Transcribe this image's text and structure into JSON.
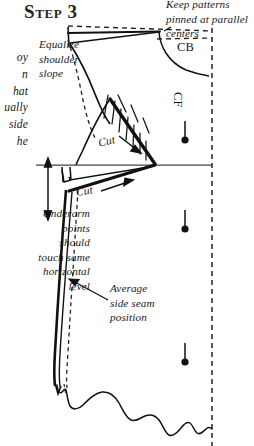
{
  "page": {
    "title": "Step 3",
    "width": 254,
    "height": 446,
    "background_color": "#ffffff",
    "ink_color": "#111111"
  },
  "heading": {
    "label": "Step 3"
  },
  "clipped_text": {
    "note": "Body paragraph running off the left page edge; only the right ends of each line are visible",
    "lines_visible": "oy\nn\nhat\nually\nside\nhe",
    "line_fragments": [
      "oy",
      "n",
      "hat",
      "ually",
      "side",
      "he"
    ]
  },
  "callouts": [
    {
      "name": "equalize-shoulder-slope",
      "text": "Equalize\nshoulder\nslope",
      "align": "left"
    },
    {
      "name": "keep-patterns-pinned",
      "text": "Keep patterns\npinned at parallel\ncenters",
      "align": "left"
    },
    {
      "name": "underarm-points",
      "text": "Underarm\npoints\nshould\ntouch same\nhorizontal\nlevel",
      "align": "right"
    },
    {
      "name": "average-side-seam",
      "text": "Average\nside seam\nposition",
      "align": "left"
    }
  ],
  "labels": {
    "center_back": "CB",
    "center_front": "CF",
    "cut_upper": "Cut",
    "cut_lower": "Cut"
  },
  "markers": {
    "pin_count": 3,
    "pin_label": "pin",
    "pin_positions": [
      {
        "x": 185,
        "y": 139
      },
      {
        "x": 185,
        "y": 228
      },
      {
        "x": 185,
        "y": 361
      }
    ]
  },
  "geometry": {
    "center_front_line_x": 212,
    "horizontal_reference_y": 165,
    "measure_arrow": {
      "x": 48,
      "y_top": 160,
      "y_bottom": 216
    }
  }
}
